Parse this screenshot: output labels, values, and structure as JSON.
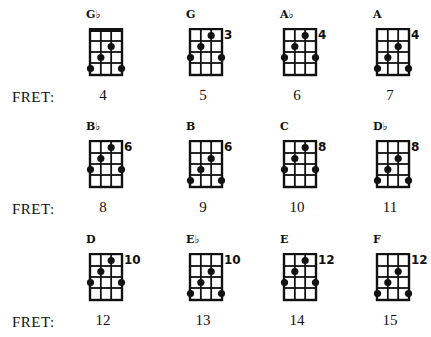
{
  "row_label": "FRET:",
  "rows": [
    {
      "chords": [
        {
          "name": "G♭",
          "fret": "4",
          "marker": "",
          "nut": true,
          "dots": [
            [
              2,
              3
            ],
            [
              3,
              2
            ],
            [
              4,
              1
            ],
            [
              4,
              4
            ]
          ]
        },
        {
          "name": "G",
          "fret": "5",
          "marker": "3",
          "nut": false,
          "dots": [
            [
              1,
              3
            ],
            [
              2,
              2
            ],
            [
              3,
              1
            ],
            [
              3,
              4
            ]
          ]
        },
        {
          "name": "A♭",
          "fret": "6",
          "marker": "4",
          "nut": false,
          "dots": [
            [
              1,
              3
            ],
            [
              2,
              2
            ],
            [
              3,
              1
            ],
            [
              3,
              4
            ]
          ]
        },
        {
          "name": "A",
          "fret": "7",
          "marker": "4",
          "nut": false,
          "dots": [
            [
              2,
              3
            ],
            [
              3,
              2
            ],
            [
              4,
              1
            ],
            [
              4,
              4
            ]
          ]
        }
      ]
    },
    {
      "chords": [
        {
          "name": "B♭",
          "fret": "8",
          "marker": "6",
          "nut": false,
          "dots": [
            [
              1,
              3
            ],
            [
              2,
              2
            ],
            [
              3,
              1
            ],
            [
              3,
              4
            ]
          ]
        },
        {
          "name": "B",
          "fret": "9",
          "marker": "6",
          "nut": false,
          "dots": [
            [
              2,
              3
            ],
            [
              3,
              2
            ],
            [
              4,
              1
            ],
            [
              4,
              4
            ]
          ]
        },
        {
          "name": "C",
          "fret": "10",
          "marker": "8",
          "nut": false,
          "dots": [
            [
              1,
              3
            ],
            [
              2,
              2
            ],
            [
              3,
              1
            ],
            [
              3,
              4
            ]
          ]
        },
        {
          "name": "D♭",
          "fret": "11",
          "marker": "8",
          "nut": false,
          "dots": [
            [
              2,
              3
            ],
            [
              3,
              2
            ],
            [
              4,
              1
            ],
            [
              4,
              4
            ]
          ]
        }
      ]
    },
    {
      "chords": [
        {
          "name": "D",
          "fret": "12",
          "marker": "10",
          "nut": false,
          "dots": [
            [
              1,
              3
            ],
            [
              2,
              2
            ],
            [
              3,
              1
            ],
            [
              3,
              4
            ]
          ]
        },
        {
          "name": "E♭",
          "fret": "13",
          "marker": "10",
          "nut": false,
          "dots": [
            [
              2,
              3
            ],
            [
              3,
              2
            ],
            [
              4,
              1
            ],
            [
              4,
              4
            ]
          ]
        },
        {
          "name": "E",
          "fret": "14",
          "marker": "12",
          "nut": false,
          "dots": [
            [
              1,
              3
            ],
            [
              2,
              2
            ],
            [
              3,
              1
            ],
            [
              3,
              4
            ]
          ]
        },
        {
          "name": "F",
          "fret": "15",
          "marker": "12",
          "nut": false,
          "dots": [
            [
              2,
              3
            ],
            [
              3,
              2
            ],
            [
              4,
              1
            ],
            [
              4,
              4
            ]
          ]
        }
      ]
    }
  ]
}
